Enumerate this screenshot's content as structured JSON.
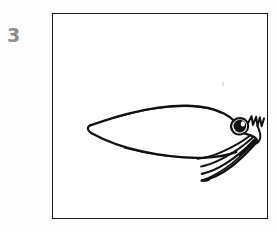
{
  "page": {
    "background_color": "#fefefe",
    "width": 277,
    "height": 231
  },
  "figure": {
    "number_label": "3",
    "number_color": "#8d8d8d"
  },
  "frame": {
    "border_color": "#1a1a1a",
    "fill_color": "#ffffff",
    "x": 52,
    "y": 13,
    "width": 216,
    "height": 206
  },
  "artwork": {
    "title": "squid-line-drawing",
    "medium": "ink-line-drawing",
    "ink_color": "#111111",
    "subject": "squid",
    "parts": [
      {
        "name": "mantle-upper-edge",
        "description": "long upward-arcing line forming the top of the squid body"
      },
      {
        "name": "mantle-lower-edge",
        "description": "long downward-arcing line forming the bottom of the squid body"
      },
      {
        "name": "mantle-tail-tip",
        "description": "pointed tail at the left end where upper and lower edges converge"
      },
      {
        "name": "head",
        "description": "small rounded head joining the mantle at the right"
      },
      {
        "name": "eye",
        "description": "solid dark round eye with a small white highlight"
      },
      {
        "name": "short-arms",
        "description": "cluster of short zigzag arms above and right of the head"
      },
      {
        "name": "tentacles",
        "description": "four long tapering tentacles sweeping down and to the left"
      }
    ]
  }
}
